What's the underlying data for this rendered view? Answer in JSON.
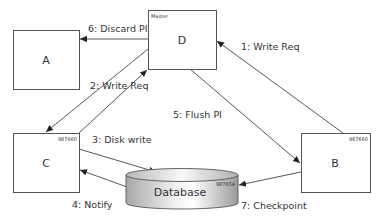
{
  "nodes": {
    "A": {
      "label": "A"
    },
    "D": {
      "label": "D",
      "role_label": "Master"
    },
    "C": {
      "label": "C",
      "value": "987660"
    },
    "B": {
      "label": "B",
      "value": "987660"
    },
    "database": {
      "label": "Database",
      "value": "987654"
    }
  },
  "edges": [
    {
      "label": "1: Write Req",
      "from": "B",
      "to": "D"
    },
    {
      "label": "2: Write Req",
      "from": "D",
      "to": "C"
    },
    {
      "label": "3: Disk write",
      "from": "C",
      "to": "database"
    },
    {
      "label": "4: Notify",
      "from": "database",
      "to": "C"
    },
    {
      "label": "5: Flush PI",
      "from": "D",
      "to": "B"
    },
    {
      "label": "6: Discard PI",
      "from": "D",
      "to": "A"
    },
    {
      "label": "7: Checkpoint",
      "from": "B",
      "to": "database"
    }
  ],
  "colors": {
    "stroke": "#444444",
    "db_light": "#f4f4f4",
    "db_dark": "#9a9a9a"
  }
}
